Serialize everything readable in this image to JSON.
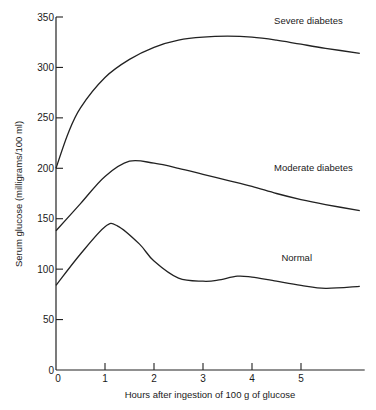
{
  "chart_data": {
    "type": "line",
    "title": "",
    "xlabel": "Hours after ingestion of 100 g of glucose",
    "ylabel": "Serum glucose (milligrams/100 ml)",
    "xlim": [
      0,
      6.3
    ],
    "ylim": [
      0,
      350
    ],
    "xticks": [
      0,
      1,
      2,
      3,
      4,
      5
    ],
    "yticks": [
      0,
      50,
      100,
      150,
      200,
      250,
      300,
      350
    ],
    "grid": false,
    "legend": "inline labels near curves",
    "series": [
      {
        "name": "Severe diabetes",
        "label_pos": {
          "x": 4.45,
          "y": 343
        },
        "x": [
          0,
          0.25,
          0.5,
          1,
          1.5,
          2,
          2.5,
          3,
          3.5,
          4,
          4.5,
          5,
          5.5,
          6.2
        ],
        "values": [
          200,
          235,
          260,
          290,
          308,
          320,
          327,
          330,
          331,
          330,
          327,
          323,
          319,
          314
        ]
      },
      {
        "name": "Moderate diabetes",
        "label_pos": {
          "x": 4.45,
          "y": 197
        },
        "x": [
          0,
          0.5,
          1,
          1.5,
          2,
          2.5,
          3,
          3.5,
          4,
          4.5,
          5,
          5.5,
          6.2
        ],
        "values": [
          138,
          165,
          192,
          207,
          205,
          200,
          194,
          188,
          182,
          175,
          169,
          164,
          158
        ]
      },
      {
        "name": "Normal",
        "label_pos": {
          "x": 4.6,
          "y": 108
        },
        "x": [
          0,
          0.5,
          1,
          1.25,
          1.7,
          2,
          2.5,
          3,
          3.3,
          3.7,
          4,
          4.5,
          5,
          5.5,
          6.2
        ],
        "values": [
          84,
          115,
          142,
          143,
          125,
          108,
          91,
          88,
          89,
          93,
          92,
          88,
          84,
          81,
          83
        ]
      }
    ]
  }
}
